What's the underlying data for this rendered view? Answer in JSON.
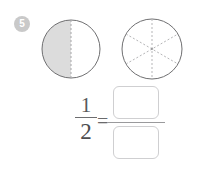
{
  "exercise": {
    "number_badge": "5",
    "badge_color": "#c9c9c9",
    "background_color": "#ffffff"
  },
  "figures": [
    {
      "name": "half-shaded-circle",
      "shape": "circle",
      "parts_total": 2,
      "parts_shaded": 1,
      "divider_style": "dashed-vertical",
      "fill_color": "#dcdcdc",
      "outline_color": "#6f6f71",
      "dash_color": "#b5b5b7"
    },
    {
      "name": "sixths-circle",
      "shape": "circle",
      "parts_total": 6,
      "parts_shaded": 0,
      "divider_style": "dashed-three-diameters",
      "fill_color": "#ffffff",
      "outline_color": "#6f6f71",
      "dash_color": "#b5b5b7"
    }
  ],
  "equation": {
    "known_fraction": {
      "numerator": "1",
      "denominator": "2"
    },
    "equals_sign": "=",
    "answer_fraction": {
      "numerator_value": "",
      "denominator_value": "",
      "numerator_placeholder": "",
      "denominator_placeholder": ""
    }
  }
}
